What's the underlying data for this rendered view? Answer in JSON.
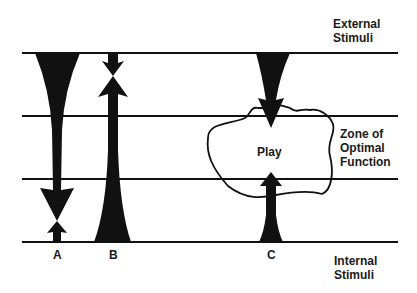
{
  "diagram": {
    "levels": {
      "top": "External\nStimuli",
      "middle": "Zone of\nOptimal\nFunction",
      "bottom": "Internal\nStimuli"
    },
    "labels": {
      "external_line1": "External",
      "external_line2": "Stimuli",
      "zone_line1": "Zone of",
      "zone_line2": "Optimal",
      "zone_line3": "Function",
      "internal_line1": "Internal",
      "internal_line2": "Stimuli",
      "play": "Play"
    },
    "columns": [
      {
        "id": "A",
        "label": "A"
      },
      {
        "id": "B",
        "label": "B"
      },
      {
        "id": "C",
        "label": "C"
      }
    ],
    "colors": {
      "ink": "#111111",
      "background": "#ffffff"
    }
  }
}
